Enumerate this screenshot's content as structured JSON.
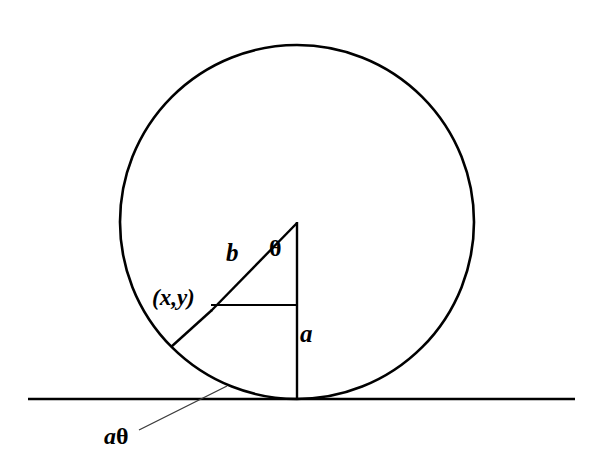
{
  "figure": {
    "background_color": "#ffffff",
    "stroke_color": "#000000",
    "labels": {
      "hypotenuse": "b",
      "angle": "θ",
      "point": "(x,y)",
      "radius": "a",
      "arc_length_prefix": "a",
      "arc_length_suffix": "θ"
    },
    "geometry": {
      "circle": {
        "cx": 297,
        "cy": 222,
        "r": 177
      },
      "ground_line": {
        "x1": 28,
        "y1": 399,
        "x2": 575,
        "y2": 399
      },
      "vertical_radius": {
        "x1": 297,
        "y1": 222,
        "x2": 297,
        "y2": 399
      },
      "hypotenuse_line": {
        "x1": 297,
        "y1": 222,
        "x2": 212,
        "y2": 310
      },
      "horizontal_segment": {
        "x1": 212,
        "y1": 305,
        "x2": 297,
        "y2": 305
      },
      "chord_to_circle": {
        "x1": 212,
        "y1": 310,
        "x2": 172,
        "y2": 346
      },
      "leader_line": {
        "x1": 140,
        "y1": 429,
        "x2": 226,
        "y2": 387
      }
    }
  }
}
